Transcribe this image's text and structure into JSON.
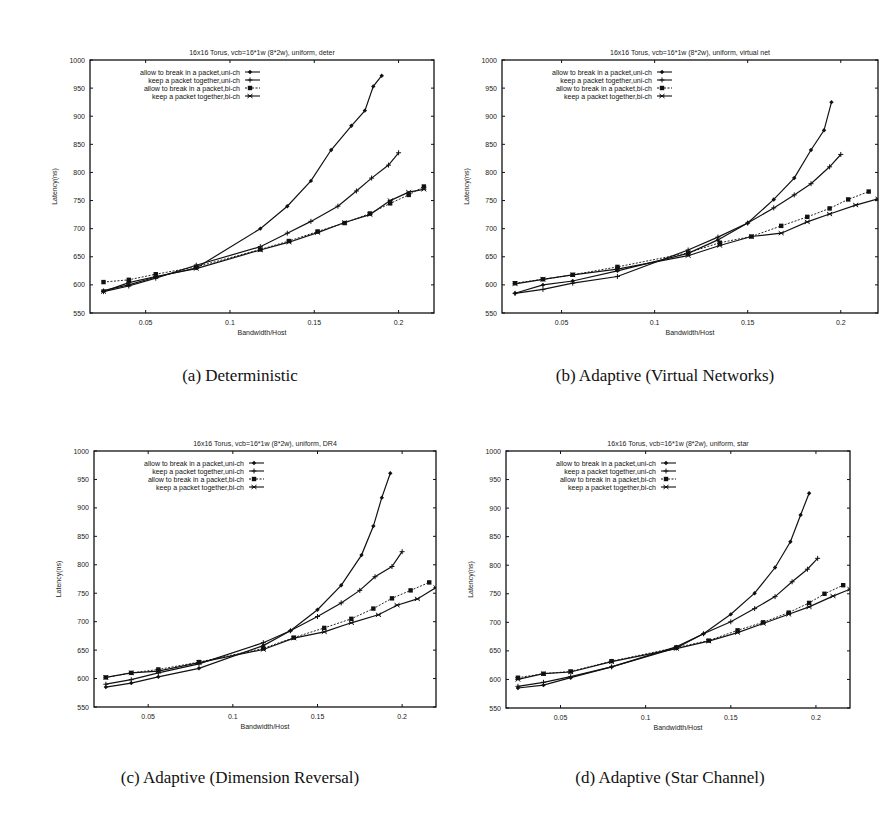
{
  "figure": {
    "captions": [
      "(a) Deterministic",
      "(b) Adaptive (Virtual Networks)",
      "(c) Adaptive (Dimension Reversal)",
      "(d) Adaptive (Star Channel)"
    ]
  },
  "chart_data": [
    {
      "type": "line",
      "title": "16x16 Torus, vcb=16*1w (8*2w), uniform, deter",
      "xlabel": "Bandwidth/Host",
      "ylabel": "Latency(ns)",
      "xlim": [
        0.017,
        0.221
      ],
      "ylim": [
        550,
        1000
      ],
      "xticks": [
        "0.05",
        "0.1",
        "0.15",
        "0.2"
      ],
      "yticks": [
        "550",
        "600",
        "650",
        "700",
        "750",
        "800",
        "850",
        "900",
        "950",
        "1000"
      ],
      "grid": false,
      "legend_position": "upper-left-inside",
      "series": [
        {
          "name": "allow to break in a packet,uni-ch",
          "x": [
            0.025,
            0.04,
            0.056,
            0.08,
            0.118,
            0.134,
            0.148,
            0.16,
            0.172,
            0.18,
            0.185,
            0.19
          ],
          "values": [
            590,
            600,
            614,
            630,
            700,
            740,
            785,
            840,
            883,
            910,
            953,
            972
          ]
        },
        {
          "name": "keep a packet together,uni-ch",
          "x": [
            0.025,
            0.04,
            0.056,
            0.08,
            0.118,
            0.134,
            0.148,
            0.164,
            0.175,
            0.184,
            0.194,
            0.2
          ],
          "values": [
            588,
            598,
            612,
            635,
            668,
            692,
            713,
            740,
            767,
            790,
            813,
            835
          ]
        },
        {
          "name": "allow to break in a packet,bi-ch",
          "x": [
            0.025,
            0.04,
            0.056,
            0.08,
            0.118,
            0.135,
            0.152,
            0.168,
            0.183,
            0.195,
            0.206,
            0.215
          ],
          "values": [
            605,
            609,
            619,
            632,
            663,
            678,
            695,
            710,
            727,
            745,
            760,
            775
          ]
        },
        {
          "name": "keep a packet together,bi-ch",
          "x": [
            0.025,
            0.04,
            0.056,
            0.08,
            0.118,
            0.135,
            0.152,
            0.168,
            0.183,
            0.195,
            0.206,
            0.215
          ],
          "values": [
            588,
            604,
            615,
            629,
            662,
            676,
            693,
            711,
            725,
            750,
            765,
            770
          ]
        }
      ]
    },
    {
      "type": "line",
      "title": "16x16 Torus, vcb=16*1w (8*2w), uniform, virtual net",
      "xlabel": "Bandwidth/Host",
      "ylabel": "Latency(ns)",
      "xlim": [
        0.018,
        0.22
      ],
      "ylim": [
        550,
        1000
      ],
      "xticks": [
        "0.05",
        "0.1",
        "0.15",
        "0.2"
      ],
      "yticks": [
        "550",
        "600",
        "650",
        "700",
        "750",
        "800",
        "850",
        "900",
        "950",
        "1000"
      ],
      "grid": false,
      "legend_position": "upper-left-inside",
      "series": [
        {
          "name": "allow to break in a packet,uni-ch",
          "x": [
            0.025,
            0.04,
            0.056,
            0.08,
            0.118,
            0.134,
            0.15,
            0.164,
            0.175,
            0.184,
            0.191,
            0.195
          ],
          "values": [
            585,
            600,
            607,
            625,
            656,
            680,
            710,
            752,
            790,
            840,
            875,
            925
          ]
        },
        {
          "name": "keep a packet together,uni-ch",
          "x": [
            0.025,
            0.04,
            0.056,
            0.08,
            0.118,
            0.134,
            0.15,
            0.164,
            0.175,
            0.184,
            0.194,
            0.2
          ],
          "values": [
            585,
            592,
            603,
            615,
            662,
            685,
            710,
            737,
            760,
            780,
            810,
            832
          ]
        },
        {
          "name": "allow to break in a packet,bi-ch",
          "x": [
            0.025,
            0.04,
            0.056,
            0.08,
            0.118,
            0.135,
            0.152,
            0.168,
            0.182,
            0.194,
            0.204,
            0.215
          ],
          "values": [
            603,
            610,
            618,
            632,
            657,
            675,
            686,
            705,
            721,
            736,
            752,
            766
          ]
        },
        {
          "name": "keep a packet together,bi-ch",
          "x": [
            0.025,
            0.04,
            0.056,
            0.08,
            0.118,
            0.135,
            0.152,
            0.168,
            0.182,
            0.194,
            0.208,
            0.22
          ],
          "values": [
            602,
            610,
            618,
            628,
            652,
            670,
            686,
            692,
            712,
            726,
            742,
            753
          ]
        }
      ]
    },
    {
      "type": "line",
      "title": "16x16 Torus, vcb=16*1w (8*2w), uniform, DR4",
      "xlabel": "Bandwidth/Host",
      "ylabel": "Latency(ns)",
      "xlim": [
        0.018,
        0.22
      ],
      "ylim": [
        550,
        1000
      ],
      "xticks": [
        "0.05",
        "0.1",
        "0.15",
        "0.2"
      ],
      "yticks": [
        "550",
        "600",
        "650",
        "700",
        "750",
        "800",
        "850",
        "900",
        "950",
        "1000"
      ],
      "grid": false,
      "legend_position": "upper-left-inside",
      "series": [
        {
          "name": "allow to break in a packet,uni-ch",
          "x": [
            0.025,
            0.04,
            0.056,
            0.08,
            0.118,
            0.134,
            0.15,
            0.164,
            0.176,
            0.183,
            0.188,
            0.193
          ],
          "values": [
            585,
            592,
            603,
            618,
            658,
            684,
            721,
            764,
            817,
            868,
            918,
            961
          ]
        },
        {
          "name": "keep a packet together,uni-ch",
          "x": [
            0.025,
            0.04,
            0.056,
            0.08,
            0.118,
            0.134,
            0.15,
            0.164,
            0.175,
            0.184,
            0.194,
            0.2
          ],
          "values": [
            590,
            598,
            610,
            626,
            663,
            684,
            709,
            733,
            755,
            779,
            797,
            823
          ]
        },
        {
          "name": "allow to break in a packet,bi-ch",
          "x": [
            0.025,
            0.04,
            0.056,
            0.08,
            0.118,
            0.136,
            0.154,
            0.17,
            0.183,
            0.194,
            0.205,
            0.216
          ],
          "values": [
            602,
            610,
            616,
            629,
            653,
            672,
            689,
            705,
            723,
            741,
            755,
            769
          ]
        },
        {
          "name": "keep a packet together,bi-ch",
          "x": [
            0.025,
            0.04,
            0.056,
            0.08,
            0.118,
            0.136,
            0.154,
            0.17,
            0.186,
            0.197,
            0.209,
            0.22
          ],
          "values": [
            602,
            610,
            613,
            628,
            651,
            671,
            682,
            698,
            712,
            729,
            740,
            760
          ]
        }
      ]
    },
    {
      "type": "line",
      "title": "16x16 Torus, vcb=16*1w (8*2w), uniform, star",
      "xlabel": "Bandwidth/Host",
      "ylabel": "Latency(ns)",
      "xlim": [
        0.018,
        0.22
      ],
      "ylim": [
        550,
        1000
      ],
      "xticks": [
        "0.05",
        "0.1",
        "0.15",
        "0.2"
      ],
      "yticks": [
        "550",
        "600",
        "650",
        "700",
        "750",
        "800",
        "850",
        "900",
        "950",
        "1000"
      ],
      "grid": false,
      "legend_position": "upper-left-inside",
      "series": [
        {
          "name": "allow to break in a packet,uni-ch",
          "x": [
            0.025,
            0.04,
            0.056,
            0.08,
            0.118,
            0.134,
            0.15,
            0.164,
            0.176,
            0.185,
            0.191,
            0.196
          ],
          "values": [
            585,
            590,
            603,
            622,
            657,
            680,
            714,
            751,
            796,
            841,
            888,
            926
          ]
        },
        {
          "name": "keep a packet together,uni-ch",
          "x": [
            0.025,
            0.04,
            0.056,
            0.08,
            0.118,
            0.134,
            0.15,
            0.164,
            0.176,
            0.186,
            0.195,
            0.201
          ],
          "values": [
            588,
            595,
            605,
            622,
            655,
            680,
            701,
            724,
            745,
            771,
            793,
            812
          ]
        },
        {
          "name": "allow to break in a packet,bi-ch",
          "x": [
            0.025,
            0.04,
            0.056,
            0.08,
            0.118,
            0.137,
            0.154,
            0.169,
            0.184,
            0.196,
            0.205,
            0.216
          ],
          "values": [
            603,
            610,
            614,
            632,
            656,
            668,
            686,
            700,
            717,
            734,
            750,
            765
          ]
        },
        {
          "name": "keep a packet together,bi-ch",
          "x": [
            0.025,
            0.04,
            0.056,
            0.08,
            0.118,
            0.137,
            0.154,
            0.169,
            0.184,
            0.196,
            0.21,
            0.22
          ],
          "values": [
            600,
            610,
            613,
            631,
            654,
            667,
            682,
            698,
            714,
            727,
            746,
            758
          ]
        }
      ]
    }
  ]
}
